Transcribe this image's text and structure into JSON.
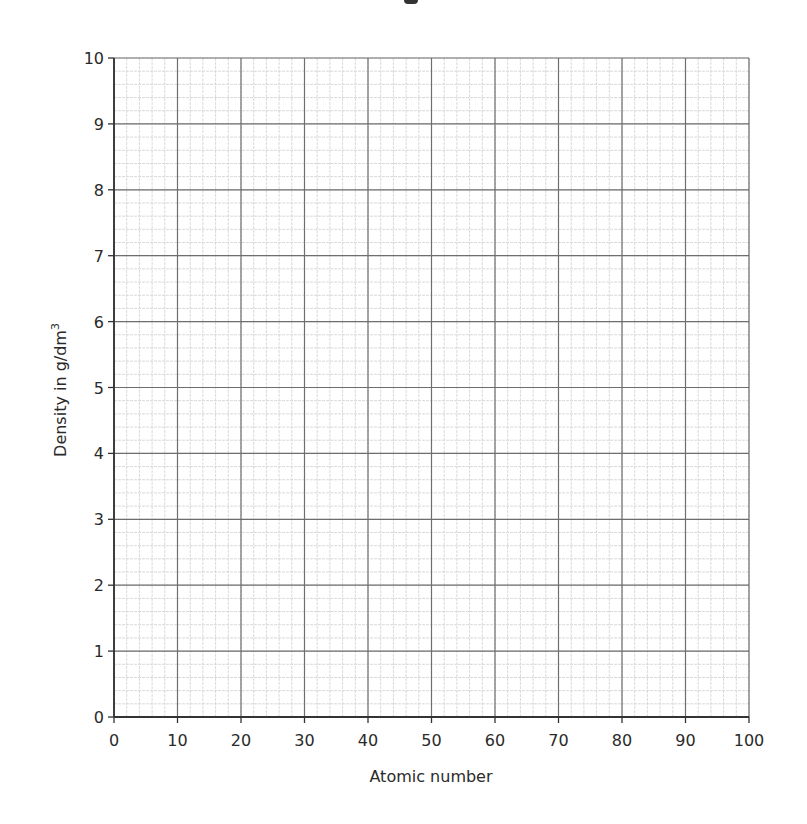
{
  "chart_data": {
    "type": "line",
    "title": "",
    "xlabel": "Atomic number",
    "ylabel": "Density in g/dm",
    "ylabel_superscript": "3",
    "xlim": [
      0,
      100
    ],
    "ylim": [
      0,
      10
    ],
    "x_ticks": [
      "0",
      "10",
      "20",
      "30",
      "40",
      "50",
      "60",
      "70",
      "80",
      "90",
      "100"
    ],
    "y_ticks": [
      "0",
      "1",
      "2",
      "3",
      "4",
      "5",
      "6",
      "7",
      "8",
      "9",
      "10"
    ],
    "grid": true,
    "grid_major_x_step": 10,
    "grid_major_y_step": 1,
    "grid_minor_subdivisions": 5,
    "series": [],
    "legend": null,
    "note": "Blank graph paper grid for plotting; no data points drawn"
  },
  "colors": {
    "major_grid": "#6e6e6e",
    "minor_grid": "#cfcfcf",
    "axis": "#333333",
    "text": "#2a2a2a"
  }
}
